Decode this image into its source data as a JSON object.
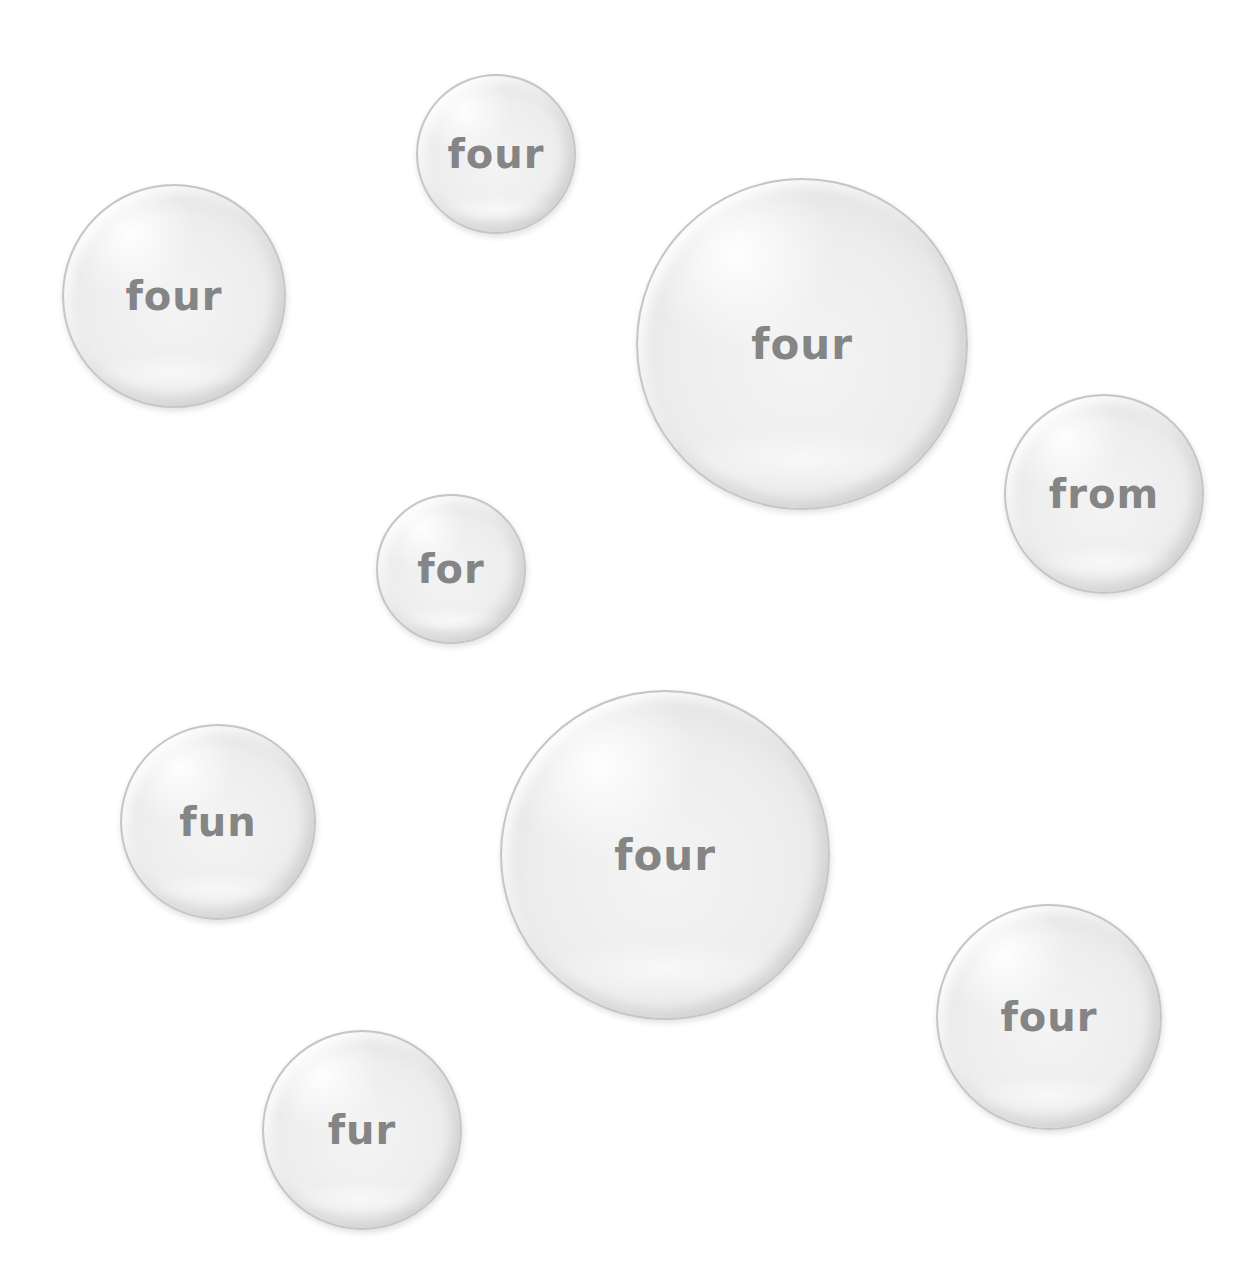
{
  "bubbles": [
    {
      "word": "four",
      "x": 416,
      "y": 74,
      "size": 160,
      "font": 40
    },
    {
      "word": "four",
      "x": 62,
      "y": 184,
      "size": 224,
      "font": 40
    },
    {
      "word": "four",
      "x": 636,
      "y": 178,
      "size": 332,
      "font": 42
    },
    {
      "word": "from",
      "x": 1004,
      "y": 394,
      "size": 200,
      "font": 40
    },
    {
      "word": "for",
      "x": 376,
      "y": 494,
      "size": 150,
      "font": 40
    },
    {
      "word": "fun",
      "x": 120,
      "y": 724,
      "size": 196,
      "font": 40
    },
    {
      "word": "four",
      "x": 500,
      "y": 690,
      "size": 330,
      "font": 42
    },
    {
      "word": "four",
      "x": 936,
      "y": 904,
      "size": 226,
      "font": 40
    },
    {
      "word": "fur",
      "x": 262,
      "y": 1030,
      "size": 200,
      "font": 40
    }
  ]
}
